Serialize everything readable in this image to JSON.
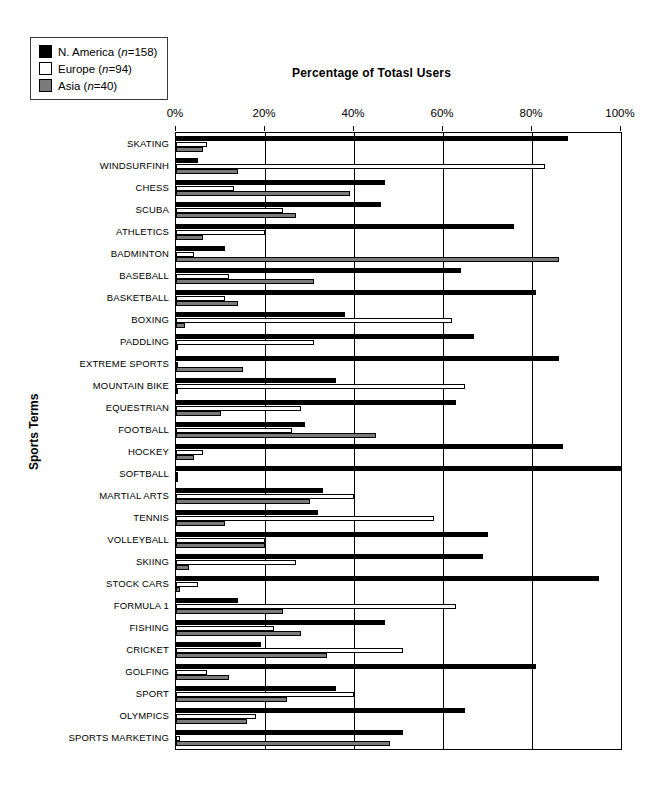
{
  "legend": {
    "position": "top-left",
    "items": [
      {
        "label": "N. America (n=158)",
        "name_plain": "N. America",
        "n": 158,
        "color": "#000000",
        "swatch": "na"
      },
      {
        "label": "Europe (n=94)",
        "name_plain": "Europe",
        "n": 94,
        "color": "#ffffff",
        "swatch": "eu"
      },
      {
        "label": "Asia (n=40)",
        "name_plain": "Asia",
        "n": 40,
        "color": "#7b7b7b",
        "swatch": "as"
      }
    ]
  },
  "chart_data": {
    "type": "bar",
    "orientation": "horizontal",
    "title": "Percentage of Totasl Users",
    "xlabel": "",
    "ylabel": "Sports Terms",
    "xlim": [
      0,
      100
    ],
    "xticks": [
      0,
      20,
      40,
      60,
      80,
      100
    ],
    "xticklabels": [
      "0%",
      "20%",
      "40%",
      "60%",
      "80%",
      "100%"
    ],
    "grid": "vertical",
    "legend_position": "top-left",
    "categories": [
      "SKATING",
      "WINDSURFINH",
      "CHESS",
      "SCUBA",
      "ATHLETICS",
      "BADMINTON",
      "BASEBALL",
      "BASKETBALL",
      "BOXING",
      "PADDLING",
      "EXTREME SPORTS",
      "MOUNTAIN BIKE",
      "EQUESTRIAN",
      "FOOTBALL",
      "HOCKEY",
      "SOFTBALL",
      "MARTIAL ARTS",
      "TENNIS",
      "VOLLEYBALL",
      "SKIING",
      "STOCK CARS",
      "FORMULA 1",
      "FISHING",
      "CRICKET",
      "GOLFING",
      "SPORT",
      "OLYMPICS",
      "SPORTS MARKETING"
    ],
    "series": [
      {
        "name": "N. America",
        "color": "#000000",
        "values": [
          88,
          5,
          47,
          46,
          76,
          11,
          64,
          81,
          38,
          67,
          86,
          36,
          63,
          29,
          87,
          100,
          33,
          32,
          70,
          69,
          95,
          14,
          47,
          19,
          81,
          36,
          65,
          51
        ]
      },
      {
        "name": "Europe",
        "color": "#ffffff",
        "values": [
          7,
          83,
          13,
          24,
          20,
          4,
          12,
          11,
          62,
          31,
          0,
          65,
          28,
          26,
          6,
          0,
          40,
          58,
          20,
          27,
          5,
          63,
          22,
          51,
          7,
          40,
          18,
          1
        ]
      },
      {
        "name": "Asia",
        "color": "#7b7b7b",
        "values": [
          6,
          14,
          39,
          27,
          6,
          86,
          31,
          14,
          2,
          0,
          15,
          0,
          10,
          45,
          4,
          0,
          30,
          11,
          20,
          3,
          1,
          24,
          28,
          34,
          12,
          25,
          16,
          48
        ]
      }
    ]
  }
}
